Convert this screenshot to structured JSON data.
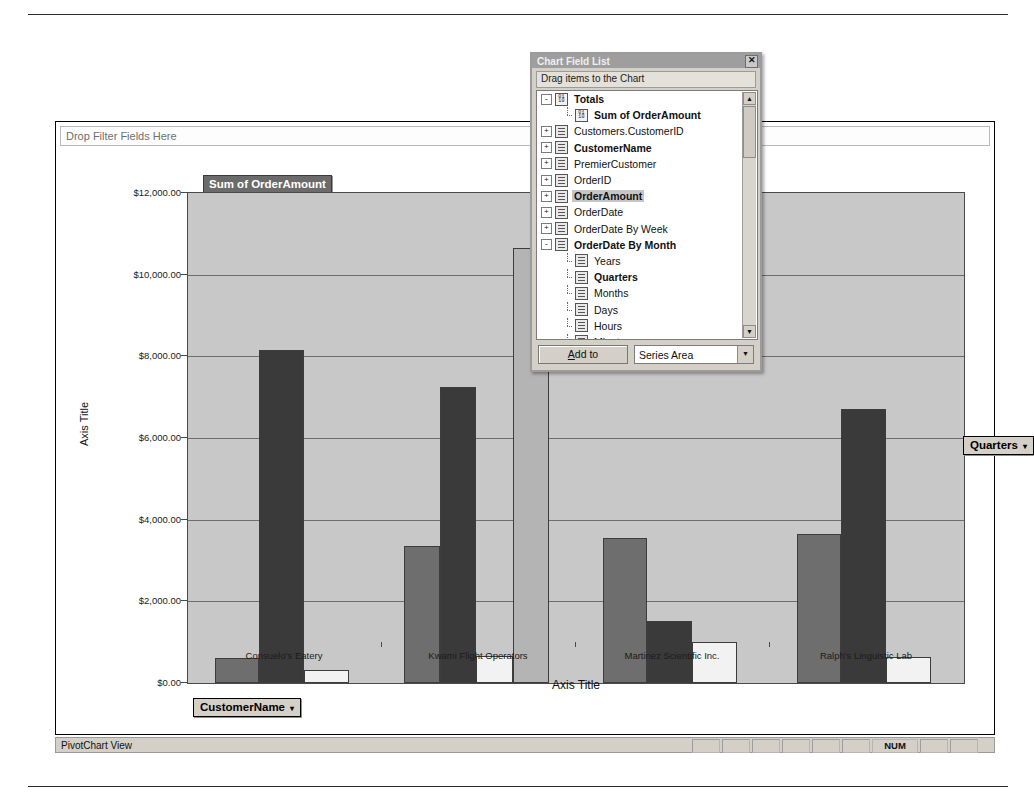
{
  "window": {
    "filter_zone_text": "Drop Filter Fields Here",
    "series_title": "Sum of OrderAmount",
    "customer_button": "CustomerName",
    "quarters_button": "Quarters",
    "caret": "▾"
  },
  "statusbar": {
    "view_label": "PivotChart View",
    "num_label": "NUM"
  },
  "field_list": {
    "title": "Chart Field List",
    "close_icon": "✕",
    "hint": "Drag items to the Chart",
    "add_to_label": "Add to",
    "add_to_underline": "A",
    "add_to_rest": "dd to",
    "target_area": "Series Area",
    "scroll_up": "▲",
    "scroll_down": "▼",
    "combo_arrow": "▼",
    "items": [
      {
        "label": "Totals",
        "indent": 0,
        "expander": "-",
        "icon": "num",
        "bold": true,
        "selected": false
      },
      {
        "label": "Sum of OrderAmount",
        "indent": 1,
        "expander": "",
        "icon": "num",
        "bold": true,
        "selected": false
      },
      {
        "label": "Customers.CustomerID",
        "indent": 0,
        "expander": "+",
        "icon": "field",
        "bold": false,
        "selected": false
      },
      {
        "label": "CustomerName",
        "indent": 0,
        "expander": "+",
        "icon": "field",
        "bold": true,
        "selected": false
      },
      {
        "label": "PremierCustomer",
        "indent": 0,
        "expander": "+",
        "icon": "field",
        "bold": false,
        "selected": false
      },
      {
        "label": "OrderID",
        "indent": 0,
        "expander": "+",
        "icon": "field",
        "bold": false,
        "selected": false
      },
      {
        "label": "OrderAmount",
        "indent": 0,
        "expander": "+",
        "icon": "field",
        "bold": true,
        "selected": true
      },
      {
        "label": "OrderDate",
        "indent": 0,
        "expander": "+",
        "icon": "field",
        "bold": false,
        "selected": false
      },
      {
        "label": "OrderDate By Week",
        "indent": 0,
        "expander": "+",
        "icon": "field",
        "bold": false,
        "selected": false
      },
      {
        "label": "OrderDate By Month",
        "indent": 0,
        "expander": "-",
        "icon": "field",
        "bold": true,
        "selected": false
      },
      {
        "label": "Years",
        "indent": 1,
        "expander": "",
        "icon": "field",
        "bold": false,
        "selected": false
      },
      {
        "label": "Quarters",
        "indent": 1,
        "expander": "",
        "icon": "field",
        "bold": true,
        "selected": false
      },
      {
        "label": "Months",
        "indent": 1,
        "expander": "",
        "icon": "field",
        "bold": false,
        "selected": false
      },
      {
        "label": "Days",
        "indent": 1,
        "expander": "",
        "icon": "field",
        "bold": false,
        "selected": false
      },
      {
        "label": "Hours",
        "indent": 1,
        "expander": "",
        "icon": "field",
        "bold": false,
        "selected": false
      },
      {
        "label": "Minutes",
        "indent": 1,
        "expander": "",
        "icon": "field",
        "bold": false,
        "selected": false
      }
    ]
  },
  "chart_data": {
    "type": "bar",
    "title": "Sum of OrderAmount",
    "xlabel": "Axis Title",
    "ylabel": "Axis Title",
    "ylim": [
      0,
      12000
    ],
    "grid": true,
    "legend_position": "none",
    "ytick_labels": [
      "$12,000.00",
      "$10,000.00",
      "$8,000.00",
      "$6,000.00",
      "$4,000.00",
      "$2,000.00",
      "$0.00"
    ],
    "ytick_values": [
      12000,
      10000,
      8000,
      6000,
      4000,
      2000,
      0
    ],
    "categories": [
      "Consuelo's Eatery",
      "Kwami Flight Operators",
      "Martinez Scientific Inc.",
      "Ralph's Linguistic Lab"
    ],
    "series": [
      {
        "name": "Q1",
        "color": "#6e6e6e",
        "values": [
          620,
          3350,
          3550,
          3650
        ]
      },
      {
        "name": "Q2",
        "color": "#3a3a3a",
        "values": [
          8150,
          7250,
          1520,
          6700
        ]
      },
      {
        "name": "Q3",
        "color": "#f2f2f2",
        "values": [
          330,
          650,
          1000,
          640
        ]
      },
      {
        "name": "Q4",
        "color": "#b4b4b4",
        "values": [
          0,
          10650,
          0,
          0
        ]
      }
    ]
  }
}
